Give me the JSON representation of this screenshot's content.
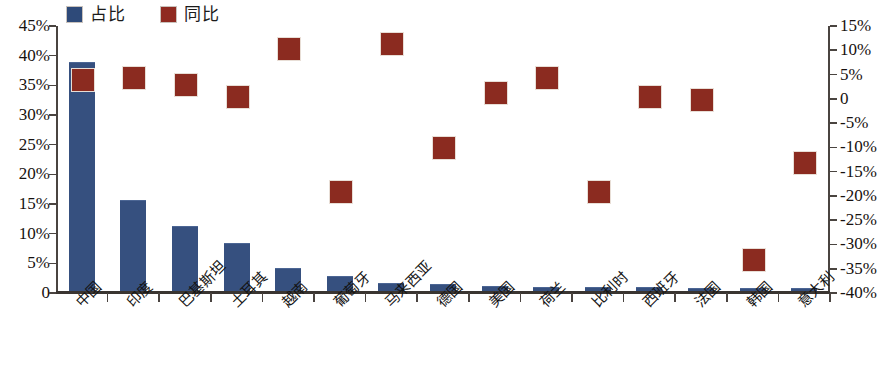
{
  "legend": {
    "items": [
      {
        "label": "占比",
        "color": "#2e4a79",
        "axis": "left"
      },
      {
        "label": "同比",
        "color": "#8f2a21",
        "axis": "right"
      }
    ]
  },
  "axes": {
    "left_ticks": [
      "45%",
      "40%",
      "35%",
      "30%",
      "25%",
      "20%",
      "15%",
      "10%",
      "5%",
      "0"
    ],
    "right_ticks": [
      "15%",
      "10%",
      "5%",
      "0",
      "-5%",
      "-10%",
      "-15%",
      "-20%",
      "-25%",
      "-30%",
      "-35%",
      "-40%"
    ]
  },
  "chart_data": {
    "type": "bar",
    "title": "",
    "xlabel": "",
    "ylabel": "",
    "categories": [
      "中国",
      "印度",
      "巴基斯坦",
      "土耳其",
      "越南",
      "葡萄牙",
      "马来西亚",
      "德国",
      "美国",
      "荷兰",
      "比利时",
      "西班牙",
      "法国",
      "韩国",
      "意大利"
    ],
    "series": [
      {
        "name": "占比",
        "type": "bar",
        "axis": "left",
        "color": "#36507f",
        "unit": "%",
        "values": [
          38.5,
          15.2,
          10.8,
          8.0,
          3.8,
          2.5,
          1.3,
          1.1,
          0.7,
          0.6,
          0.5,
          0.5,
          0.4,
          0.3,
          0.3
        ]
      },
      {
        "name": "同比",
        "type": "scatter",
        "axis": "right",
        "color": "#8b2b20",
        "unit": "%",
        "marker": "square",
        "values": [
          4,
          4.5,
          3,
          0.5,
          10.5,
          -19,
          11.5,
          -10,
          1.5,
          4.5,
          -19,
          0.5,
          0,
          -33,
          -13
        ]
      }
    ],
    "ylim_left": [
      0,
      45
    ],
    "ylim_right": [
      -40,
      15
    ],
    "grid": false,
    "legend_position": "top-left"
  }
}
